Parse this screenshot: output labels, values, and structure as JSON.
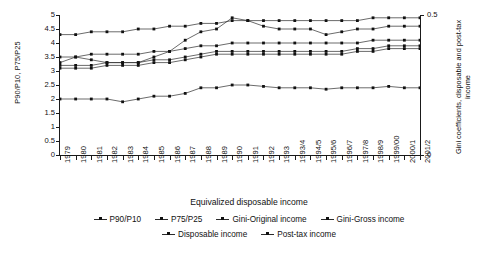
{
  "chart_data": {
    "type": "line",
    "title": "",
    "xlabel": "Equivalized disposable income",
    "ylabel": "P90/P10, P75/P25",
    "y2label": "Gini coefficients, disposable and post-tax income",
    "ylim": [
      0,
      5
    ],
    "y2lim": [
      0,
      0.5
    ],
    "grid": false,
    "legend_position": "bottom",
    "yticks": [
      "0",
      "0.5",
      "1",
      "1.5",
      "2",
      "2.5",
      "3",
      "3.5",
      "4",
      "4.5",
      "5"
    ],
    "y2ticks": [
      "0",
      "0.5"
    ],
    "categories": [
      "1979",
      "1980",
      "1981",
      "1982",
      "1983",
      "1984",
      "1985",
      "1986",
      "1987",
      "1988",
      "1989",
      "1990",
      "1991",
      "1992",
      "1993",
      "1993/4",
      "1994/5",
      "1995/6",
      "1996/7",
      "1997/8",
      "1998/9",
      "1999/00",
      "2000/1",
      "2001/2"
    ],
    "series": [
      {
        "name": "P90/P10",
        "axis": "left",
        "values": [
          3.3,
          3.5,
          3.4,
          3.3,
          3.3,
          3.3,
          3.5,
          3.7,
          4.1,
          4.4,
          4.5,
          4.9,
          4.8,
          4.6,
          4.5,
          4.5,
          4.5,
          4.3,
          4.4,
          4.5,
          4.5,
          4.6,
          4.6,
          4.6
        ]
      },
      {
        "name": "P75/P25",
        "axis": "left",
        "values": [
          2.0,
          2.0,
          2.0,
          2.0,
          1.9,
          2.0,
          2.1,
          2.1,
          2.2,
          2.4,
          2.4,
          2.5,
          2.5,
          2.45,
          2.4,
          2.4,
          2.4,
          2.35,
          2.4,
          2.4,
          2.4,
          2.45,
          2.4,
          2.4
        ]
      },
      {
        "name": "Gini-Original income",
        "axis": "right",
        "values": [
          0.43,
          0.43,
          0.44,
          0.44,
          0.44,
          0.45,
          0.45,
          0.46,
          0.46,
          0.47,
          0.47,
          0.48,
          0.48,
          0.48,
          0.48,
          0.48,
          0.48,
          0.48,
          0.48,
          0.48,
          0.49,
          0.49,
          0.49,
          0.49
        ]
      },
      {
        "name": "Gini-Gross income",
        "axis": "right",
        "values": [
          0.35,
          0.35,
          0.36,
          0.36,
          0.36,
          0.36,
          0.37,
          0.37,
          0.38,
          0.39,
          0.39,
          0.4,
          0.4,
          0.4,
          0.4,
          0.4,
          0.4,
          0.4,
          0.4,
          0.4,
          0.41,
          0.41,
          0.41,
          0.41
        ]
      },
      {
        "name": "Disposable income",
        "axis": "right",
        "values": [
          0.32,
          0.32,
          0.32,
          0.33,
          0.33,
          0.33,
          0.34,
          0.34,
          0.35,
          0.36,
          0.37,
          0.37,
          0.37,
          0.37,
          0.37,
          0.37,
          0.37,
          0.37,
          0.37,
          0.38,
          0.38,
          0.39,
          0.39,
          0.39
        ]
      },
      {
        "name": "Post-tax income",
        "axis": "right",
        "values": [
          0.31,
          0.31,
          0.31,
          0.32,
          0.32,
          0.32,
          0.33,
          0.33,
          0.34,
          0.35,
          0.36,
          0.36,
          0.36,
          0.36,
          0.36,
          0.36,
          0.36,
          0.36,
          0.36,
          0.37,
          0.37,
          0.38,
          0.38,
          0.38
        ]
      }
    ],
    "colors": {
      "line": "#2b2b2b",
      "marker": "#111111",
      "axis": "#1a1a1a",
      "background": "#ffffff"
    }
  },
  "legend": {
    "row1": [
      "P90/P10",
      "P75/P25",
      "Gini-Original income",
      "Gini-Gross income"
    ],
    "row2": [
      "Disposable income",
      "Post-tax income"
    ]
  }
}
